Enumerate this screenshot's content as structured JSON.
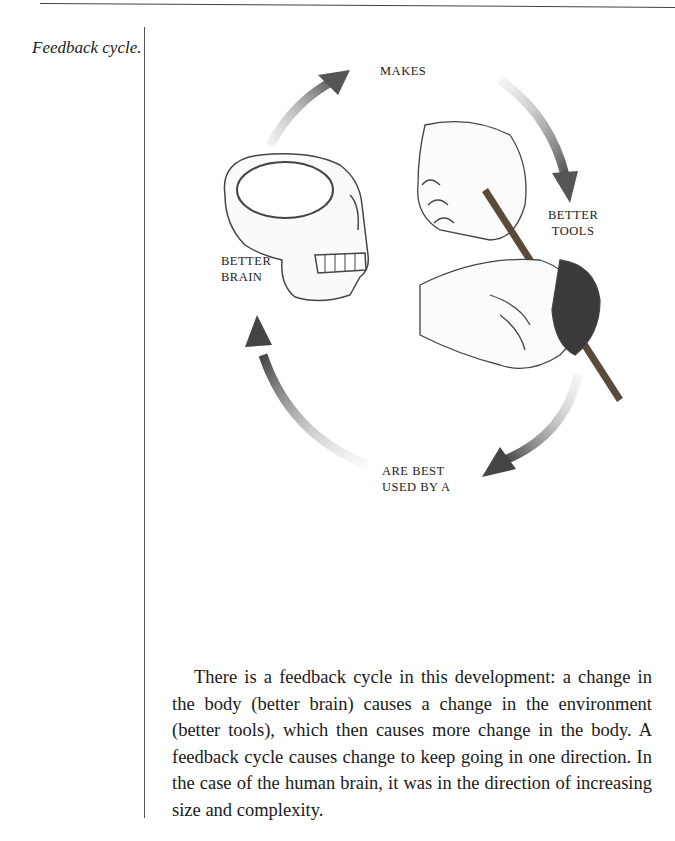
{
  "margin_note": "Feedback cycle.",
  "figure": {
    "labels": {
      "makes": "MAKES",
      "better_tools_1": "BETTER",
      "better_tools_2": "TOOLS",
      "are_best_1": "ARE BEST",
      "are_best_2": "USED BY A",
      "better_brain_1": "BETTER",
      "better_brain_2": "BRAIN"
    },
    "illustrations": [
      "skull-illustration",
      "hands-shaping-stone-tool-illustration"
    ],
    "arrow_color": "#555555"
  },
  "body": {
    "paragraph": "There is a feedback cycle in this development: a change in the body (better brain) causes a change in the environment (better tools), which then causes more change in the body. A feedback cycle causes change to keep going in one direction. In the case of the human brain, it was in the direction of increasing size and complexity."
  }
}
